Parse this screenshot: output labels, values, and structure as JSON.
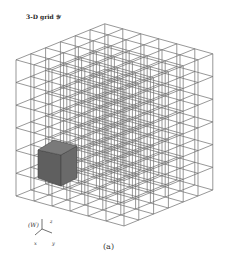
{
  "figure": {
    "title": "3-D grid 𝒴",
    "caption": "(a)",
    "grid": {
      "cells_per_axis": 6,
      "origin": [
        124,
        226
      ],
      "axis_left": [
        -18,
        -5
      ],
      "axis_right": [
        14.8,
        -6
      ],
      "axis_up": [
        0,
        -22.7
      ],
      "line_color": "#6b6b6b",
      "highlight_color": "#666666"
    },
    "highlight_cube": {
      "description": "shaded cell",
      "faces": {
        "left": [
          [
            38,
            150
          ],
          [
            61,
            155
          ],
          [
            61,
            186
          ],
          [
            38,
            178
          ]
        ],
        "right": [
          [
            61,
            155
          ],
          [
            77,
            146
          ],
          [
            77,
            178
          ],
          [
            61,
            186
          ]
        ],
        "top": [
          [
            38,
            150
          ],
          [
            54,
            140
          ],
          [
            77,
            146
          ],
          [
            61,
            155
          ]
        ]
      }
    },
    "axes_triad": {
      "frame_label": "(W)",
      "z_label": "z",
      "x_label": "x",
      "y_label": "y"
    }
  }
}
